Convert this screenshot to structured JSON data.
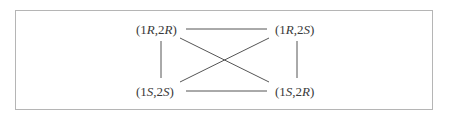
{
  "diagram": {
    "nodes": [
      {
        "id": "RR",
        "label": "(1R,2R)",
        "parts": [
          "(1",
          "R",
          ",2",
          "R",
          ")"
        ]
      },
      {
        "id": "RS",
        "label": "(1R,2S)",
        "parts": [
          "(1",
          "R",
          ",2",
          "S",
          ")"
        ]
      },
      {
        "id": "SS",
        "label": "(1S,2S)",
        "parts": [
          "(1",
          "S",
          ",2",
          "S",
          ")"
        ]
      },
      {
        "id": "SR",
        "label": "(1S,2R)",
        "parts": [
          "(1",
          "S",
          ",2",
          "R",
          ")"
        ]
      }
    ],
    "edges": [
      {
        "from": "RR",
        "to": "RS"
      },
      {
        "from": "SS",
        "to": "SR"
      },
      {
        "from": "RR",
        "to": "SS"
      },
      {
        "from": "RS",
        "to": "SR"
      },
      {
        "from": "RR",
        "to": "SR"
      },
      {
        "from": "RS",
        "to": "SS"
      }
    ],
    "colors": {
      "line": "#555555",
      "text": "#3a3a3a",
      "border": "#b5b5b5"
    }
  }
}
